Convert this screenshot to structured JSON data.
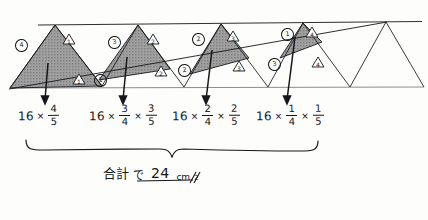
{
  "document": {
    "kind": "handwritten-math-worksheet",
    "language": "ja"
  },
  "diagram": {
    "name": "zigzag-triangle-strip",
    "shaded_fill": "#9a9a9a",
    "ink_color": "#15171a",
    "labels": [
      {
        "id": "c4",
        "text": "4",
        "style": "circled"
      },
      {
        "id": "t1a",
        "text": "1",
        "style": "triangle"
      },
      {
        "id": "t1b",
        "text": "1",
        "style": "triangle"
      },
      {
        "id": "c1a",
        "text": "1",
        "style": "circled"
      },
      {
        "id": "c3",
        "text": "3",
        "style": "circled"
      },
      {
        "id": "t2a",
        "text": "2",
        "style": "triangle"
      },
      {
        "id": "t2b",
        "text": "2",
        "style": "triangle"
      },
      {
        "id": "c2b",
        "text": "2",
        "style": "circled"
      },
      {
        "id": "c2",
        "text": "2",
        "style": "circled"
      },
      {
        "id": "t3a",
        "text": "3",
        "style": "triangle"
      },
      {
        "id": "t3b",
        "text": "3",
        "style": "triangle"
      },
      {
        "id": "c3b",
        "text": "3",
        "style": "circled"
      },
      {
        "id": "c1",
        "text": "1",
        "style": "circled"
      },
      {
        "id": "t4a",
        "text": "4",
        "style": "triangle"
      },
      {
        "id": "t4b",
        "text": "4",
        "style": "triangle"
      }
    ]
  },
  "formulas": [
    {
      "id": "formula-1",
      "base": "16",
      "times": "×",
      "fractions": [
        {
          "numerator": "4",
          "denominator": "5"
        }
      ],
      "plain": "16 × 4/5"
    },
    {
      "id": "formula-2",
      "base": "16",
      "times": "×",
      "fractions": [
        {
          "numerator": "3",
          "denominator": "4"
        },
        {
          "numerator": "3",
          "denominator": "5"
        }
      ],
      "plain": "16 × 3/4 × 3/5"
    },
    {
      "id": "formula-3",
      "base": "16",
      "times": "×",
      "fractions": [
        {
          "numerator": "2",
          "denominator": "4"
        },
        {
          "numerator": "2",
          "denominator": "5"
        }
      ],
      "plain": "16 × 2/4 × 2/5"
    },
    {
      "id": "formula-4",
      "base": "16",
      "times": "×",
      "fractions": [
        {
          "numerator": "1",
          "denominator": "4"
        },
        {
          "numerator": "1",
          "denominator": "5"
        }
      ],
      "plain": "16 × 1/4 × 1/5"
    }
  ],
  "summary": {
    "label_jp": "合計",
    "particle_jp": "で",
    "answer_value": "24",
    "answer_unit": "cm",
    "answer_exponent": "2",
    "answer_full": "24 cm²"
  }
}
